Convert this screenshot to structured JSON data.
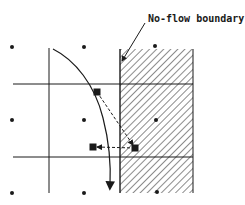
{
  "diagram": {
    "label": "No-flow boundary",
    "colors": {
      "ink": "#1a1a1a",
      "background": "#ffffff"
    },
    "grid": {
      "vertical_lines_x": [
        49,
        120,
        193
      ],
      "horizontal_lines_y": [
        84,
        157
      ],
      "node_dots": [
        [
          12,
          47
        ],
        [
          84,
          47
        ],
        [
          155,
          46
        ],
        [
          12,
          120
        ],
        [
          84,
          120
        ],
        [
          156,
          120
        ],
        [
          12,
          193
        ],
        [
          84,
          193
        ],
        [
          157,
          192
        ]
      ]
    },
    "hatched_region": {
      "x": 120,
      "y": 49,
      "width": 73,
      "height": 144
    },
    "particles": [
      {
        "name": "start",
        "x": 97,
        "y": 92
      },
      {
        "name": "reflected",
        "x": 135,
        "y": 148
      },
      {
        "name": "end",
        "x": 93,
        "y": 147
      }
    ],
    "flow_path": "curved streamline with arrowhead pointing down"
  }
}
